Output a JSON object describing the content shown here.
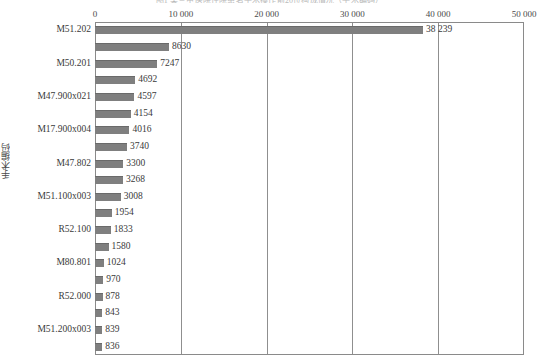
{
  "chart_data": {
    "type": "bar",
    "orientation": "horizontal",
    "title": "图1 某三甲医院住院患者手术操作前20位构成情况（手术编码）",
    "xlabel": "",
    "ylabel": "手术编码",
    "xlim": [
      0,
      50000
    ],
    "xticks": [
      0,
      10000,
      20000,
      30000,
      40000,
      50000
    ],
    "xticklabels": [
      "0",
      "10 000",
      "20 000",
      "30 000",
      "40 000",
      "50 000"
    ],
    "grid": true,
    "legend": false,
    "bar_color": "#7f7f7f",
    "categories": [
      "M51.202",
      "",
      "M50.201",
      "",
      "M47.900x021",
      "",
      "M17.900x004",
      "",
      "M47.802",
      "",
      "M51.100x003",
      "",
      "R52.100",
      "",
      "M80.801",
      "",
      "R52.000",
      "",
      "M51.200x003",
      ""
    ],
    "values": [
      38239,
      8630,
      7247,
      4692,
      4597,
      4154,
      4016,
      3740,
      3300,
      3268,
      3008,
      1954,
      1833,
      1580,
      1024,
      970,
      878,
      843,
      839,
      836
    ],
    "value_labels": [
      "38 239",
      "8630",
      "7247",
      "4692",
      "4597",
      "4154",
      "4016",
      "3740",
      "3300",
      "3268",
      "3008",
      "1954",
      "1833",
      "1580",
      "1024",
      "970",
      "878",
      "843",
      "839",
      "836"
    ],
    "ytick_labels_visible": [
      "M51.202",
      "M50.201",
      "M47.900x021",
      "M17.900x004",
      "M47.802",
      "M51.100x003",
      "R52.100",
      "M80.801",
      "R52.000",
      "M51.200x003"
    ]
  }
}
